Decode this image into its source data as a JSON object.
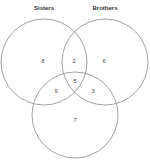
{
  "diagram": {
    "type": "venn",
    "sets": [
      {
        "name": "Sisters",
        "color": "#8a8a8a"
      },
      {
        "name": "Brothers",
        "color": "#8a8a8a"
      },
      {
        "name": "",
        "color": "#8a8a8a"
      }
    ],
    "regions": {
      "sisters_only": "8",
      "sisters_brothers": "2",
      "brothers_only": "6",
      "all_three": "5",
      "sisters_third": "9",
      "brothers_third": "3",
      "third_only": "7"
    }
  }
}
